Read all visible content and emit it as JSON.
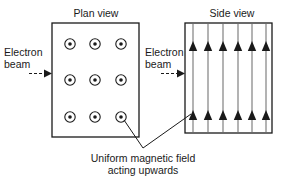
{
  "figure": {
    "type": "physics-diagram",
    "background_color": "#ffffff",
    "stroke_color": "#1a1a1a",
    "field_line_color": "#808080"
  },
  "plan_view": {
    "title": "Plan view",
    "beam_label_line1": "Electron",
    "beam_label_line2": "beam",
    "field_symbol": "dot-in-circle",
    "field_symbol_meaning": "field out of page",
    "rows": 3,
    "columns": 3,
    "box": {
      "x": 52,
      "y": 23,
      "width": 87,
      "height": 114
    }
  },
  "side_view": {
    "title": "Side view",
    "beam_label_line1": "Electron",
    "beam_label_line2": "beam",
    "field_symbol": "up-arrow",
    "field_symbol_meaning": "field upwards in plane of page",
    "line_count": 6,
    "arrowheads_per_line": 2,
    "box": {
      "x": 185,
      "y": 23,
      "width": 87,
      "height": 110
    }
  },
  "caption": {
    "line1": "Uniform magnetic field",
    "line2": "acting upwards"
  }
}
